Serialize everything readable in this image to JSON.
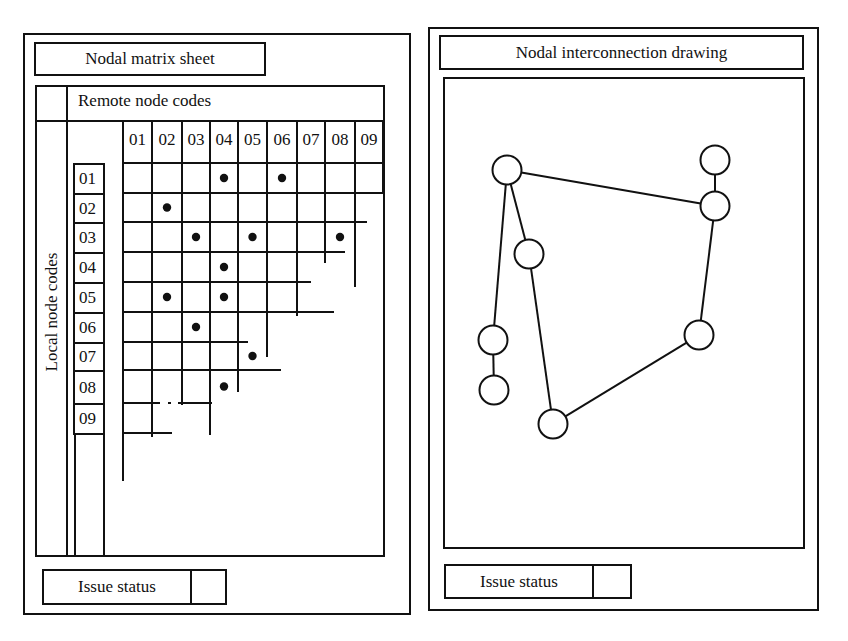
{
  "left_panel": {
    "title": "Nodal matrix sheet",
    "column_header_label": "Remote node codes",
    "row_header_label": "Local node codes",
    "remote_node_codes": [
      "01",
      "02",
      "03",
      "04",
      "05",
      "06",
      "07",
      "08",
      "09"
    ],
    "local_node_codes": [
      "01",
      "02",
      "03",
      "04",
      "05",
      "06",
      "07",
      "08",
      "09"
    ],
    "connections": [
      {
        "local": "01",
        "remote": "04"
      },
      {
        "local": "01",
        "remote": "06"
      },
      {
        "local": "02",
        "remote": "02"
      },
      {
        "local": "03",
        "remote": "03"
      },
      {
        "local": "03",
        "remote": "05"
      },
      {
        "local": "03",
        "remote": "08"
      },
      {
        "local": "04",
        "remote": "04"
      },
      {
        "local": "05",
        "remote": "02"
      },
      {
        "local": "05",
        "remote": "04"
      },
      {
        "local": "06",
        "remote": "03"
      },
      {
        "local": "07",
        "remote": "05"
      },
      {
        "local": "08",
        "remote": "04"
      }
    ],
    "issue_status_label": "Issue status",
    "issue_status_value": ""
  },
  "right_panel": {
    "title": "Nodal interconnection drawing",
    "nodes": [
      {
        "id": "A",
        "x": 507,
        "y": 170
      },
      {
        "id": "B",
        "x": 715,
        "y": 160
      },
      {
        "id": "C",
        "x": 715,
        "y": 206
      },
      {
        "id": "D",
        "x": 529,
        "y": 254
      },
      {
        "id": "E",
        "x": 493,
        "y": 340
      },
      {
        "id": "F",
        "x": 494,
        "y": 390
      },
      {
        "id": "G",
        "x": 553,
        "y": 424
      },
      {
        "id": "H",
        "x": 699,
        "y": 335
      }
    ],
    "edges": [
      [
        "A",
        "C"
      ],
      [
        "B",
        "C"
      ],
      [
        "A",
        "D"
      ],
      [
        "A",
        "E"
      ],
      [
        "E",
        "F"
      ],
      [
        "D",
        "G"
      ],
      [
        "G",
        "H"
      ],
      [
        "H",
        "C"
      ]
    ],
    "issue_status_label": "Issue status",
    "issue_status_value": ""
  }
}
